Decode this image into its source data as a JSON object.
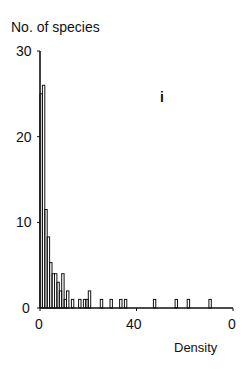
{
  "chart_data": {
    "type": "bar",
    "title": "",
    "panel_label": "i",
    "xlabel": "Density",
    "ylabel": "No. of species",
    "ylim": [
      0,
      30
    ],
    "xlim": [
      0,
      80
    ],
    "yticks": [
      0,
      10,
      20,
      30
    ],
    "ytick_labels": [
      "0",
      "10",
      "20",
      "30"
    ],
    "xticks": [
      0,
      40,
      80
    ],
    "xtick_labels": [
      "0",
      "40",
      "0"
    ],
    "grid": false,
    "legend": null,
    "bar_width": 1,
    "bins": [
      {
        "x": 0,
        "value": 25
      },
      {
        "x": 1,
        "value": 26
      },
      {
        "x": 2,
        "value": 11.5
      },
      {
        "x": 3,
        "value": 8.3
      },
      {
        "x": 4,
        "value": 5.3
      },
      {
        "x": 5,
        "value": 4
      },
      {
        "x": 6,
        "value": 4
      },
      {
        "x": 7,
        "value": 3
      },
      {
        "x": 8,
        "value": 2
      },
      {
        "x": 9,
        "value": 4
      },
      {
        "x": 10,
        "value": 1
      },
      {
        "x": 11,
        "value": 2
      },
      {
        "x": 13,
        "value": 1
      },
      {
        "x": 16,
        "value": 1
      },
      {
        "x": 18,
        "value": 1
      },
      {
        "x": 19,
        "value": 1
      },
      {
        "x": 20,
        "value": 2
      },
      {
        "x": 25,
        "value": 1
      },
      {
        "x": 29,
        "value": 1
      },
      {
        "x": 33,
        "value": 1
      },
      {
        "x": 35,
        "value": 1
      },
      {
        "x": 47,
        "value": 1
      },
      {
        "x": 56,
        "value": 1
      },
      {
        "x": 61,
        "value": 1
      },
      {
        "x": 70,
        "value": 1
      }
    ]
  }
}
